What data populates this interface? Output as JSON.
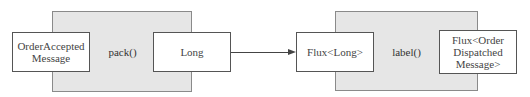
{
  "diagram": {
    "stages": [
      {
        "operation": "pack()",
        "input": "OrderAccepted\nMessage",
        "input_lines": [
          "OrderAccepted",
          "Message"
        ],
        "output": "Long"
      },
      {
        "operation": "label()",
        "input": "Flux<Long>",
        "output": "Flux<Order Dispatched Message>",
        "output_lines": [
          "Flux<Order",
          "Dispatched",
          "Message>"
        ]
      }
    ],
    "connector": {
      "from": "Long",
      "to": "Flux<Long>",
      "type": "arrow"
    }
  }
}
